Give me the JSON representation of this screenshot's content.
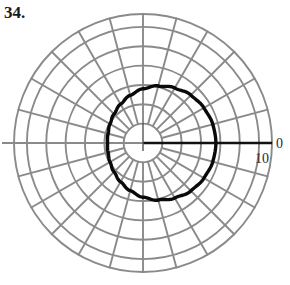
{
  "figure": {
    "problem_number": "34.",
    "type": "polar-plot",
    "background_color": "#ffffff"
  },
  "axis": {
    "polar_axis_label": "0",
    "radial_tick_label": "10",
    "axis_color": "#111111",
    "grid_color": "#8a8a8a",
    "curve_color": "#0a0a0a"
  },
  "chart_data": {
    "type": "line",
    "coordinate_system": "polar",
    "title": "34.",
    "xlabel": "",
    "ylabel": "",
    "grid": true,
    "grid_kind": "polar",
    "legend": "none",
    "center_px": [
      143,
      143
    ],
    "pixels_per_unit": 6.45,
    "radial_gridlines": {
      "values": [
        3,
        6,
        9,
        12,
        15,
        18,
        20
      ],
      "labeled": [
        10
      ],
      "tick_label_text": "10",
      "outer_radius": 20
    },
    "angular_gridlines": {
      "count": 24,
      "step_degrees": 15,
      "labeled": [
        0
      ],
      "tick_label_text": "0"
    },
    "series": [
      {
        "name": "limacon",
        "equation": "r = a + b cos(theta)",
        "a": 8.4,
        "b": 2.9,
        "theta_degrees": [
          0,
          15,
          30,
          45,
          60,
          75,
          90,
          105,
          120,
          135,
          150,
          165,
          180,
          195,
          210,
          225,
          240,
          255,
          270,
          285,
          300,
          315,
          330,
          345,
          360
        ],
        "r": [
          11.3,
          11.2,
          10.9,
          10.5,
          9.85,
          9.15,
          8.4,
          7.65,
          6.95,
          6.35,
          5.9,
          5.6,
          5.5,
          5.6,
          5.9,
          6.35,
          6.95,
          7.65,
          8.4,
          9.15,
          9.85,
          10.5,
          10.9,
          11.2,
          11.3
        ],
        "line_width_px": 3.4,
        "closed": true
      }
    ],
    "ylim": [
      0,
      20
    ],
    "theta_zero_location": "E",
    "theta_direction": "counterclockwise"
  }
}
